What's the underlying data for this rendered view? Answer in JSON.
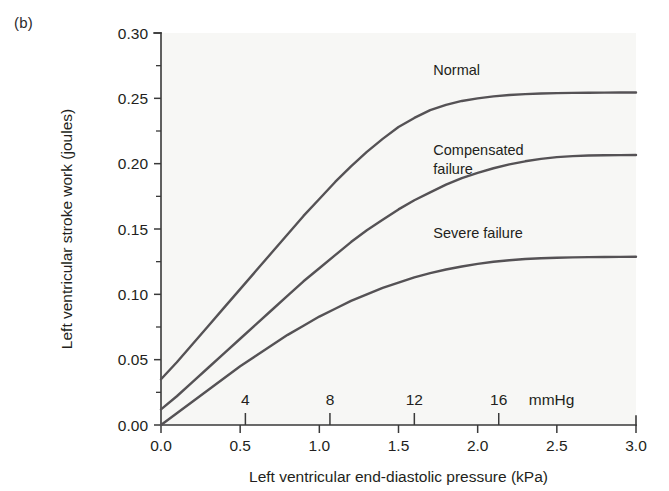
{
  "figure": {
    "panel_label": "(b)"
  },
  "chart_data": {
    "type": "line",
    "title": "",
    "xlabel": "Left ventricular end-diastolic pressure (kPa)",
    "ylabel": "Left ventricular stroke work (joules)",
    "xlim": [
      0.0,
      3.0
    ],
    "ylim": [
      0.0,
      0.3
    ],
    "grid": false,
    "legend_position": "inline-curve-labels",
    "x_ticks": [
      0.0,
      0.5,
      1.0,
      1.5,
      2.0,
      2.5,
      3.0
    ],
    "x_tick_labels": [
      "0.0",
      "0.5",
      "1.0",
      "1.5",
      "2.0",
      "2.5",
      "3.0"
    ],
    "y_ticks": [
      0.0,
      0.05,
      0.1,
      0.15,
      0.2,
      0.25,
      0.3
    ],
    "y_tick_labels": [
      "0.00",
      "0.05",
      "0.10",
      "0.15",
      "0.20",
      "0.25",
      "0.30"
    ],
    "y_minor_ticks": [
      0.025,
      0.075,
      0.125,
      0.175,
      0.225,
      0.275
    ],
    "secondary_x_axis": {
      "unit_label": "mmHg",
      "ticks_mmhg": [
        4,
        8,
        12,
        16
      ],
      "tick_labels": [
        "4",
        "8",
        "12",
        "16"
      ],
      "ticks_in_kpa": [
        0.533,
        1.067,
        1.6,
        2.133
      ]
    },
    "x": [
      0.0,
      0.1,
      0.2,
      0.3,
      0.4,
      0.5,
      0.6,
      0.7,
      0.8,
      0.9,
      1.0,
      1.1,
      1.2,
      1.3,
      1.4,
      1.5,
      1.6,
      1.7,
      1.8,
      1.9,
      2.0,
      2.1,
      2.2,
      2.3,
      2.4,
      2.5,
      2.6,
      2.7,
      2.8,
      2.9,
      3.0
    ],
    "series": [
      {
        "name": "Normal",
        "label": "Normal",
        "color": "#555255",
        "label_pos": {
          "x": 1.72,
          "y": 0.268
        },
        "values": [
          0.035,
          0.048,
          0.062,
          0.076,
          0.09,
          0.104,
          0.118,
          0.132,
          0.146,
          0.16,
          0.173,
          0.186,
          0.198,
          0.209,
          0.219,
          0.228,
          0.235,
          0.241,
          0.245,
          0.248,
          0.25,
          0.2515,
          0.2525,
          0.2532,
          0.2537,
          0.254,
          0.2542,
          0.2543,
          0.2544,
          0.2545,
          0.2545
        ]
      },
      {
        "name": "Compensated failure",
        "label_line1": "Compensated",
        "label_line2": "failure",
        "color": "#555255",
        "label_pos": {
          "x": 1.72,
          "y": 0.207
        },
        "values": [
          0.012,
          0.022,
          0.033,
          0.044,
          0.055,
          0.066,
          0.077,
          0.088,
          0.099,
          0.11,
          0.12,
          0.13,
          0.14,
          0.149,
          0.157,
          0.165,
          0.172,
          0.178,
          0.184,
          0.189,
          0.193,
          0.1965,
          0.1995,
          0.2018,
          0.2037,
          0.205,
          0.2058,
          0.2062,
          0.2064,
          0.2065,
          0.2066
        ]
      },
      {
        "name": "Severe failure",
        "label": "Severe failure",
        "color": "#555255",
        "label_pos": {
          "x": 1.72,
          "y": 0.143
        },
        "values": [
          0.0,
          0.009,
          0.018,
          0.027,
          0.036,
          0.045,
          0.053,
          0.061,
          0.069,
          0.076,
          0.083,
          0.089,
          0.095,
          0.1,
          0.105,
          0.109,
          0.113,
          0.1162,
          0.119,
          0.1213,
          0.1233,
          0.1249,
          0.1261,
          0.127,
          0.1276,
          0.128,
          0.1283,
          0.1285,
          0.1286,
          0.1287,
          0.1288
        ]
      }
    ]
  }
}
